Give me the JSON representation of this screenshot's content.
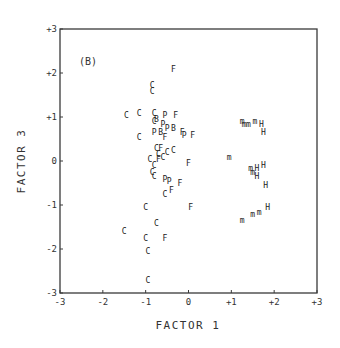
{
  "chart_data": {
    "type": "scatter",
    "title": "",
    "panel_label": "(B)",
    "xlabel": "FACTOR 1",
    "ylabel": "FACTOR 3",
    "xlim": [
      -3,
      3
    ],
    "ylim": [
      -3,
      3
    ],
    "x_ticks": [
      "-3",
      "-2",
      "-1",
      "0",
      "+1",
      "+2",
      "+3"
    ],
    "y_ticks": [
      "-3",
      "-2",
      "-1",
      "0",
      "+1",
      "+2",
      "+3"
    ],
    "grid": false,
    "legend": null,
    "marker_style": "letter symbols",
    "series": [
      {
        "name": "C",
        "symbol": "C",
        "points": [
          [
            -0.85,
            1.72
          ],
          [
            -0.85,
            1.58
          ],
          [
            -1.45,
            1.05
          ],
          [
            -1.15,
            1.08
          ],
          [
            -0.8,
            1.1
          ],
          [
            -0.8,
            0.9
          ],
          [
            -1.15,
            0.55
          ],
          [
            -0.75,
            0.3
          ],
          [
            -0.7,
            0.15
          ],
          [
            -0.6,
            0.1
          ],
          [
            -0.5,
            0.2
          ],
          [
            -0.35,
            0.25
          ],
          [
            -0.8,
            -0.1
          ],
          [
            -0.85,
            -0.25
          ],
          [
            -0.8,
            -0.35
          ],
          [
            -0.55,
            -0.75
          ],
          [
            -1.0,
            -1.05
          ],
          [
            -0.75,
            -1.4
          ],
          [
            -1.5,
            -1.6
          ],
          [
            -1.0,
            -1.75
          ],
          [
            -0.95,
            -2.05
          ],
          [
            -0.95,
            -2.7
          ],
          [
            -0.9,
            0.05
          ]
        ]
      },
      {
        "name": "F",
        "symbol": "F",
        "points": [
          [
            -0.35,
            2.1
          ],
          [
            -0.3,
            1.05
          ],
          [
            -0.65,
            0.3
          ],
          [
            -0.15,
            0.65
          ],
          [
            0.1,
            0.6
          ],
          [
            -0.7,
            0.05
          ],
          [
            0.0,
            -0.05
          ],
          [
            -0.2,
            -0.5
          ],
          [
            -0.4,
            -0.65
          ],
          [
            0.05,
            -1.05
          ],
          [
            -0.55,
            -1.75
          ],
          [
            -0.55,
            0.55
          ]
        ]
      },
      {
        "name": "P",
        "symbol": "P",
        "points": [
          [
            -0.55,
            1.05
          ],
          [
            -0.6,
            0.85
          ],
          [
            -0.5,
            0.75
          ],
          [
            -0.8,
            0.65
          ],
          [
            -0.1,
            0.6
          ],
          [
            -0.45,
            -0.45
          ],
          [
            -0.55,
            -0.4
          ]
        ]
      },
      {
        "name": "B",
        "symbol": "B",
        "points": [
          [
            -0.75,
            0.95
          ],
          [
            -0.35,
            0.75
          ],
          [
            -0.65,
            0.65
          ]
        ]
      },
      {
        "name": "m",
        "symbol": "m",
        "points": [
          [
            1.25,
            0.9
          ],
          [
            1.3,
            0.85
          ],
          [
            1.4,
            0.85
          ],
          [
            1.55,
            0.9
          ],
          [
            0.95,
            0.1
          ],
          [
            1.45,
            -0.15
          ],
          [
            1.5,
            -0.25
          ],
          [
            1.5,
            -1.2
          ],
          [
            1.65,
            -1.15
          ],
          [
            1.25,
            -1.35
          ]
        ]
      },
      {
        "name": "H",
        "symbol": "H",
        "points": [
          [
            1.7,
            0.85
          ],
          [
            1.75,
            0.65
          ],
          [
            1.6,
            -0.15
          ],
          [
            1.75,
            -0.1
          ],
          [
            1.6,
            -0.35
          ],
          [
            1.8,
            -0.55
          ],
          [
            1.85,
            -1.05
          ]
        ]
      }
    ]
  }
}
